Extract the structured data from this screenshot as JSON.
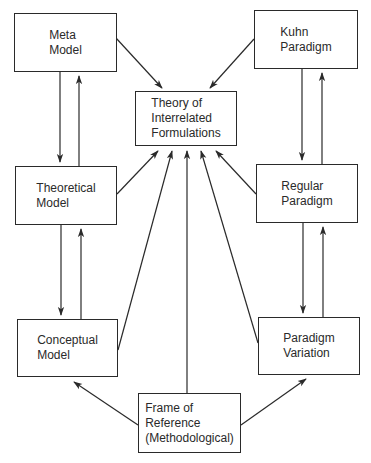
{
  "diagram": {
    "nodes": [
      {
        "id": "meta",
        "label": "Meta\nModel",
        "x": 14,
        "y": 13,
        "w": 103,
        "h": 59
      },
      {
        "id": "kuhn",
        "label": "Kuhn\nParadigm",
        "x": 254,
        "y": 10,
        "w": 104,
        "h": 59
      },
      {
        "id": "theory",
        "label": "Theory of\nInterrelated\nFormulations",
        "x": 135,
        "y": 91,
        "w": 102,
        "h": 55
      },
      {
        "id": "theoretical",
        "label": "Theoretical\nModel",
        "x": 15,
        "y": 166,
        "w": 102,
        "h": 59
      },
      {
        "id": "regular",
        "label": "Regular\nParadigm",
        "x": 256,
        "y": 164,
        "w": 102,
        "h": 59
      },
      {
        "id": "conceptual",
        "label": "Conceptual\nModel",
        "x": 17,
        "y": 319,
        "w": 101,
        "h": 58
      },
      {
        "id": "variation",
        "label": "Paradigm\nVariation",
        "x": 258,
        "y": 317,
        "w": 102,
        "h": 58
      },
      {
        "id": "frame",
        "label": "Frame of\nReference\n(Methodological)",
        "x": 138,
        "y": 393,
        "w": 103,
        "h": 60
      }
    ],
    "edges": [
      {
        "from": "meta",
        "to": "theory",
        "x1": 116,
        "y1": 38,
        "x2": 162,
        "y2": 88
      },
      {
        "from": "kuhn",
        "to": "theory",
        "x1": 254,
        "y1": 39,
        "x2": 210,
        "y2": 88
      },
      {
        "from": "meta",
        "to": "theoretical",
        "x1": 60,
        "y1": 72,
        "x2": 60,
        "y2": 162
      },
      {
        "from": "theoretical",
        "to": "meta",
        "x1": 79,
        "y1": 166,
        "x2": 79,
        "y2": 76
      },
      {
        "from": "theoretical",
        "to": "conceptual",
        "x1": 61,
        "y1": 225,
        "x2": 61,
        "y2": 315
      },
      {
        "from": "conceptual",
        "to": "theoretical",
        "x1": 81,
        "y1": 319,
        "x2": 81,
        "y2": 229
      },
      {
        "from": "kuhn",
        "to": "regular",
        "x1": 302,
        "y1": 69,
        "x2": 302,
        "y2": 160
      },
      {
        "from": "regular",
        "to": "kuhn",
        "x1": 322,
        "y1": 164,
        "x2": 322,
        "y2": 73
      },
      {
        "from": "regular",
        "to": "variation",
        "x1": 303,
        "y1": 223,
        "x2": 303,
        "y2": 313
      },
      {
        "from": "variation",
        "to": "regular",
        "x1": 323,
        "y1": 317,
        "x2": 323,
        "y2": 227
      },
      {
        "from": "theoretical",
        "to": "theory",
        "x1": 117,
        "y1": 194,
        "x2": 158,
        "y2": 151
      },
      {
        "from": "conceptual",
        "to": "theory",
        "x1": 118,
        "y1": 350,
        "x2": 172,
        "y2": 151
      },
      {
        "from": "frame",
        "to": "theory",
        "x1": 187,
        "y1": 393,
        "x2": 187,
        "y2": 151
      },
      {
        "from": "variation",
        "to": "theory",
        "x1": 258,
        "y1": 343,
        "x2": 201,
        "y2": 151
      },
      {
        "from": "regular",
        "to": "theory",
        "x1": 256,
        "y1": 194,
        "x2": 216,
        "y2": 151
      },
      {
        "from": "frame",
        "to": "conceptual",
        "x1": 138,
        "y1": 425,
        "x2": 74,
        "y2": 382
      },
      {
        "from": "frame",
        "to": "variation",
        "x1": 241,
        "y1": 425,
        "x2": 306,
        "y2": 379
      }
    ],
    "stroke_color": "#2a2a2a"
  }
}
